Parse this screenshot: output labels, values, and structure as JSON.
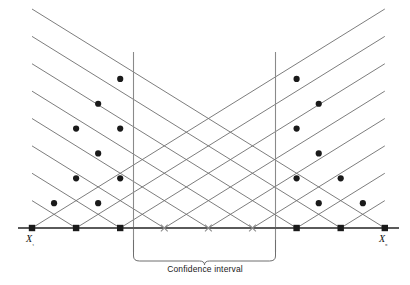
{
  "figure": {
    "type": "lattice-diagram"
  },
  "labels": {
    "x_first": "X₁",
    "x_last": "X₉",
    "confidence_interval_caption": "Confidence interval"
  },
  "colors": {
    "lattice_line": "#6e6e6e",
    "baseline": "#5a5a5a",
    "vertical_guide": "#8a8a8a",
    "dot_fill": "#1a1a1a",
    "cross_stroke": "#8d8d8d",
    "brace": "#6e6e6e",
    "background": "#ffffff",
    "text": "#111111"
  },
  "chart_data": {
    "type": "scatter",
    "xlabel": "",
    "ylabel": "",
    "grid": false,
    "legend": null,
    "axis": {
      "baseline_y": 228,
      "xlim": [
        18,
        399
      ],
      "apex": {
        "x": 209.0,
        "y": 9.0
      }
    },
    "observations": {
      "count": 9,
      "names": [
        "X₁",
        "X₂",
        "X₃",
        "X₄",
        "X₅",
        "X₆",
        "X₇",
        "X₈",
        "X₉"
      ],
      "x_positions": [
        32.0,
        76.1,
        120.2,
        164.3,
        208.4,
        252.5,
        296.6,
        340.7,
        384.8
      ],
      "baseline_marker_types": [
        "square",
        "square",
        "square",
        "cross",
        "cross",
        "cross",
        "square",
        "square",
        "square"
      ]
    },
    "confidence_interval": {
      "lower_x": 133.5,
      "upper_x": 275.5,
      "lower_label": "lower limit",
      "upper_label": "upper limit",
      "caption": "Confidence interval"
    },
    "lattice": {
      "description": "Diamond lattice of Walsh averages; lines of slope +1 and -1 from each observation on the baseline; filled circular markers at lattice nodes on or outside the confidence limits.",
      "slope_rise_per_half_step": 24.85,
      "half_step_x": 22.05,
      "marked_nodes": [
        {
          "x": 32.0,
          "y": 228.0,
          "marker": "square"
        },
        {
          "x": 76.1,
          "y": 228.0,
          "marker": "square"
        },
        {
          "x": 120.2,
          "y": 228.0,
          "marker": "square"
        },
        {
          "x": 164.3,
          "y": 228.0,
          "marker": "cross"
        },
        {
          "x": 208.4,
          "y": 228.0,
          "marker": "cross"
        },
        {
          "x": 252.5,
          "y": 228.0,
          "marker": "cross"
        },
        {
          "x": 296.6,
          "y": 228.0,
          "marker": "square"
        },
        {
          "x": 340.7,
          "y": 228.0,
          "marker": "square"
        },
        {
          "x": 384.8,
          "y": 228.0,
          "marker": "square"
        },
        {
          "x": 54.05,
          "y": 203.15,
          "marker": "dot"
        },
        {
          "x": 98.15,
          "y": 203.15,
          "marker": "dot"
        },
        {
          "x": 318.75,
          "y": 203.15,
          "marker": "dot"
        },
        {
          "x": 362.85,
          "y": 203.15,
          "marker": "dot"
        },
        {
          "x": 76.1,
          "y": 178.3,
          "marker": "dot"
        },
        {
          "x": 120.2,
          "y": 178.3,
          "marker": "dot"
        },
        {
          "x": 296.6,
          "y": 178.3,
          "marker": "dot"
        },
        {
          "x": 340.7,
          "y": 178.3,
          "marker": "dot"
        },
        {
          "x": 98.15,
          "y": 153.45,
          "marker": "dot"
        },
        {
          "x": 318.75,
          "y": 153.45,
          "marker": "dot"
        },
        {
          "x": 76.1,
          "y": 128.6,
          "marker": "dot"
        },
        {
          "x": 120.2,
          "y": 128.6,
          "marker": "dot"
        },
        {
          "x": 296.6,
          "y": 128.6,
          "marker": "dot"
        },
        {
          "x": 98.15,
          "y": 103.75,
          "marker": "dot"
        },
        {
          "x": 318.75,
          "y": 103.75,
          "marker": "dot"
        },
        {
          "x": 120.2,
          "y": 78.9,
          "marker": "dot"
        },
        {
          "x": 296.6,
          "y": 78.9,
          "marker": "dot"
        }
      ]
    }
  }
}
